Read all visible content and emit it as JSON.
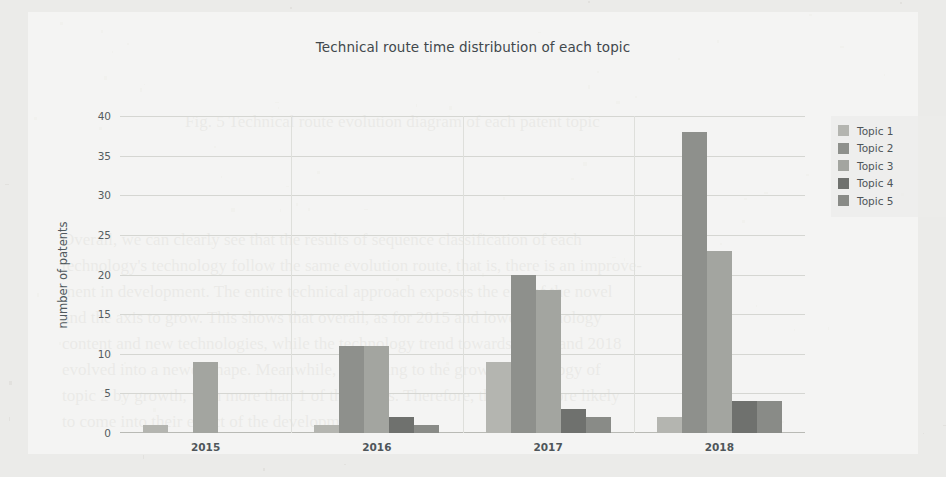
{
  "chart_data": {
    "type": "bar",
    "title": "Technical route time distribution of each topic",
    "xlabel": "",
    "ylabel": "number of patents",
    "categories": [
      "2015",
      "2016",
      "2017",
      "2018"
    ],
    "series": [
      {
        "name": "Topic 1",
        "color": "#b4b5b0",
        "values": [
          1,
          1,
          9,
          2
        ]
      },
      {
        "name": "Topic 2",
        "color": "#8e908c",
        "values": [
          0,
          11,
          20,
          38
        ]
      },
      {
        "name": "Topic 3",
        "color": "#a3a5a0",
        "values": [
          9,
          11,
          18,
          23
        ]
      },
      {
        "name": "Topic 4",
        "color": "#6f716e",
        "values": [
          0,
          2,
          3,
          4
        ]
      },
      {
        "name": "Topic 5",
        "color": "#898b87",
        "values": [
          0,
          1,
          2,
          4
        ]
      }
    ],
    "ylim": [
      0,
      40
    ],
    "yticks": [
      0,
      5,
      10,
      15,
      20,
      25,
      30,
      35,
      40
    ],
    "grid": true,
    "legend_position": "right",
    "legend_entries": [
      "Topic 1",
      "Topic 2",
      "Topic 3",
      "Topic 4",
      "Topic 5"
    ]
  },
  "background_text": [
    {
      "text": "Fig. 5   Technical route evolution diagram of each patent topic",
      "left": 185,
      "top": 112,
      "size": 17
    },
    {
      "text": "Overall, we can clearly see that the results of sequence classification of each",
      "left": 62,
      "top": 230,
      "size": 17
    },
    {
      "text": "technology's technology follow the same evolution route, that is, there is an improve-",
      "left": 62,
      "top": 256,
      "size": 17
    },
    {
      "text": "ment in development. The entire technical approach exposes the end of the novel",
      "left": 62,
      "top": 282,
      "size": 17
    },
    {
      "text": "and the axis to grow. This shows that overall, as for 2015 and lower technology",
      "left": 62,
      "top": 308,
      "size": 17
    },
    {
      "text": "content and new technologies, while the technology trend towards 2017, and 2018",
      "left": 62,
      "top": 334,
      "size": 17
    },
    {
      "text": "evolved into a newer shape. Meanwhile, according to the growth technology of",
      "left": 62,
      "top": 360,
      "size": 17
    },
    {
      "text": "topic 2 by growth, with more than 1 of the topics. Therefore, there are more likely",
      "left": 62,
      "top": 386,
      "size": 17
    },
    {
      "text": "to come into their effect of the development.",
      "left": 62,
      "top": 412,
      "size": 17
    }
  ]
}
